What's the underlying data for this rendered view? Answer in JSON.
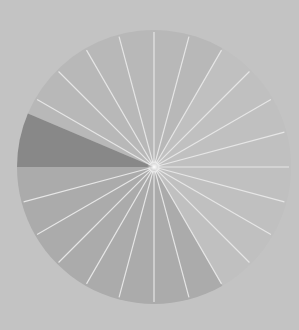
{
  "figure": {
    "center": [
      154,
      167
    ],
    "radius": 137,
    "background_color": "#c3c3c3",
    "spoke_color": "#e6e6e6",
    "spoke_count": 24,
    "spoke_angle_step_deg": 15,
    "spoke_inner_radius": 4,
    "center_glow_color": "#ffffff",
    "sectors": [
      {
        "name": "upper-light",
        "start_deg": 60,
        "end_deg": 157,
        "color": "#b8b8b8"
      },
      {
        "name": "dark-wedge",
        "start_deg": 157,
        "end_deg": 180,
        "color": "#888888"
      },
      {
        "name": "lower-medium",
        "start_deg": 180,
        "end_deg": 300,
        "color": "#ababab"
      },
      {
        "name": "right-faint",
        "start_deg": 300,
        "end_deg": 420,
        "color": "#c0c0c0"
      }
    ],
    "spokes_hidden_in": [
      "dark-wedge"
    ]
  }
}
